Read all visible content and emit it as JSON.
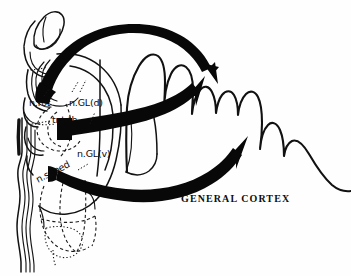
{
  "figure": {
    "background_color": "#fefefe",
    "ink_color": "#0a0a0a",
    "width": 351,
    "height": 276
  },
  "labels": {
    "n_rot": "n.rot",
    "n_gl_d": "n.GL(d)",
    "tr_t_th": "tr.t-th",
    "n_gl_v": "n.GL(v)",
    "n_spped": "n.spped",
    "general_cortex": "GENERAL   CORTEX"
  },
  "structures": {
    "olfactory_bulb": "olfactory-bulb-outline",
    "thalamus": "thalamus-outline",
    "brainstem": "brainstem-outline",
    "hemisphere": "cerebral-hemisphere-outline",
    "cortical_folds": "cortical-gyri-wave"
  },
  "arrows": [
    {
      "name": "projection-arrow-dorsal",
      "from": "n.rot",
      "to": "GENERAL CORTEX",
      "direction": "arc-over-top"
    },
    {
      "name": "projection-arrow-middle",
      "from": "tr.t-th",
      "to": "GENERAL CORTEX",
      "direction": "sweep-up-right"
    },
    {
      "name": "projection-arrow-ventral",
      "from": "n.spped",
      "to": "GENERAL CORTEX",
      "direction": "sweep-right"
    }
  ]
}
